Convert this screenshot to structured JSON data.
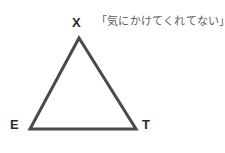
{
  "canvas": {
    "width": 225,
    "height": 153,
    "background_color": "#ffffff"
  },
  "diagram": {
    "type": "triangle",
    "stroke_color": "#4a4a4a",
    "stroke_width": 3,
    "fill": "none",
    "vertices": [
      {
        "name": "apex",
        "label": "X",
        "x": 79,
        "y": 38
      },
      {
        "name": "bottom-left",
        "label": "E",
        "x": 30,
        "y": 129
      },
      {
        "name": "bottom-right",
        "label": "T",
        "x": 136,
        "y": 129
      }
    ],
    "points_path": "79,38 30,129 136,129"
  },
  "labels": {
    "apex": "X",
    "bottom_left": "E",
    "bottom_right": "T",
    "color": "#2b2b2b"
  },
  "annotation": {
    "quote": "「気にかけてくれてない」",
    "color": "#5d5d5d"
  }
}
